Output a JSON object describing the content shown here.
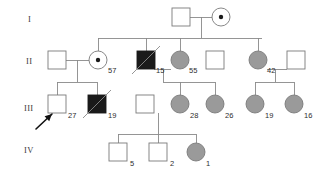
{
  "diagram": {
    "type": "pedigree-chart",
    "title": "",
    "generations": [
      {
        "label": "I",
        "x": 28,
        "y": 14
      },
      {
        "label": "II",
        "x": 26,
        "y": 56
      },
      {
        "label": "III",
        "x": 24,
        "y": 103
      },
      {
        "label": "IV",
        "x": 24,
        "y": 145
      }
    ],
    "colors": {
      "line": "#8a8a8a",
      "affected_fill": "#1a1a1a",
      "partial_fill": "#9a9a9a",
      "unaffected_fill": "#ffffff",
      "stroke": "#7a7a7a",
      "text": "#2e2e2e",
      "arrow": "#111111"
    },
    "individuals": [
      {
        "id": "I-1",
        "shape": "square",
        "status": "unaffected",
        "x": 181,
        "y": 17,
        "label": "",
        "label_x": 0,
        "label_y": 0,
        "deceased": false,
        "carrier": false
      },
      {
        "id": "I-2",
        "shape": "circle",
        "status": "carrier",
        "x": 221,
        "y": 17,
        "label": "",
        "label_x": 0,
        "label_y": 0,
        "deceased": false,
        "carrier": true
      },
      {
        "id": "II-1",
        "shape": "square",
        "status": "unaffected",
        "x": 57,
        "y": 60,
        "label": "",
        "label_x": 0,
        "label_y": 0,
        "deceased": false,
        "carrier": false
      },
      {
        "id": "II-2",
        "shape": "circle",
        "status": "carrier",
        "x": 98,
        "y": 60,
        "label": "57",
        "label_x": 108,
        "label_y": 66,
        "deceased": false,
        "carrier": true
      },
      {
        "id": "II-3",
        "shape": "square",
        "status": "affected",
        "x": 146,
        "y": 60,
        "label": "15",
        "label_x": 156,
        "label_y": 66,
        "deceased": true,
        "carrier": false
      },
      {
        "id": "II-4",
        "shape": "circle",
        "status": "partial",
        "x": 180,
        "y": 60,
        "label": "55",
        "label_x": 189,
        "label_y": 66,
        "deceased": false,
        "carrier": false
      },
      {
        "id": "II-5",
        "shape": "square",
        "status": "unaffected",
        "x": 215,
        "y": 60,
        "label": "",
        "label_x": 0,
        "label_y": 0,
        "deceased": false,
        "carrier": false
      },
      {
        "id": "II-6",
        "shape": "circle",
        "status": "partial",
        "x": 258,
        "y": 60,
        "label": "42",
        "label_x": 267,
        "label_y": 66,
        "deceased": false,
        "carrier": false
      },
      {
        "id": "II-7",
        "shape": "square",
        "status": "unaffected",
        "x": 296,
        "y": 60,
        "label": "",
        "label_x": 0,
        "label_y": 0,
        "deceased": false,
        "carrier": false
      },
      {
        "id": "III-1",
        "shape": "square",
        "status": "unaffected",
        "x": 57,
        "y": 104,
        "label": "27",
        "label_x": 68,
        "label_y": 111,
        "deceased": false,
        "carrier": false
      },
      {
        "id": "III-2",
        "shape": "square",
        "status": "affected",
        "x": 97,
        "y": 104,
        "label": "19",
        "label_x": 108,
        "label_y": 111,
        "deceased": true,
        "carrier": false
      },
      {
        "id": "III-3",
        "shape": "square",
        "status": "unaffected",
        "x": 145,
        "y": 104,
        "label": "",
        "label_x": 0,
        "label_y": 0,
        "deceased": false,
        "carrier": false
      },
      {
        "id": "III-4",
        "shape": "circle",
        "status": "partial",
        "x": 180,
        "y": 104,
        "label": "28",
        "label_x": 190,
        "label_y": 111,
        "deceased": false,
        "carrier": false
      },
      {
        "id": "III-5",
        "shape": "circle",
        "status": "partial",
        "x": 215,
        "y": 104,
        "label": "26",
        "label_x": 225,
        "label_y": 111,
        "deceased": false,
        "carrier": false
      },
      {
        "id": "III-6",
        "shape": "circle",
        "status": "partial",
        "x": 255,
        "y": 104,
        "label": "19",
        "label_x": 265,
        "label_y": 111,
        "deceased": false,
        "carrier": false
      },
      {
        "id": "III-7",
        "shape": "circle",
        "status": "partial",
        "x": 294,
        "y": 104,
        "label": "16",
        "label_x": 304,
        "label_y": 111,
        "deceased": false,
        "carrier": false
      },
      {
        "id": "IV-1",
        "shape": "square",
        "status": "unaffected",
        "x": 118,
        "y": 152,
        "label": "5",
        "label_x": 130,
        "label_y": 159,
        "deceased": false,
        "carrier": false
      },
      {
        "id": "IV-2",
        "shape": "square",
        "status": "unaffected",
        "x": 158,
        "y": 152,
        "label": "2",
        "label_x": 170,
        "label_y": 159,
        "deceased": false,
        "carrier": false
      },
      {
        "id": "IV-3",
        "shape": "circle",
        "status": "partial",
        "x": 196,
        "y": 152,
        "label": "1",
        "label_x": 206,
        "label_y": 159,
        "deceased": false,
        "carrier": false
      }
    ],
    "proband": {
      "id": "III-1",
      "arrow_from_x": 36,
      "arrow_from_y": 129,
      "arrow_to_x": 52,
      "arrow_to_y": 114
    },
    "shape_size": {
      "square": 18,
      "circle_r": 9
    }
  }
}
